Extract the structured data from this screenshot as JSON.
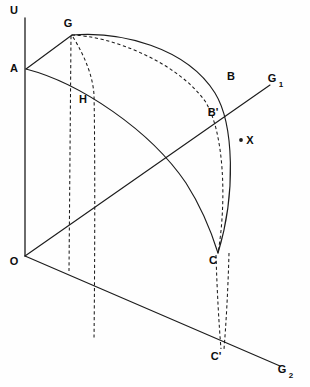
{
  "figure": {
    "background_color": "#fefefe",
    "stroke_color": "#1c1c1c",
    "width": 310,
    "height": 387
  },
  "axes": {
    "vertical": {
      "label": "U",
      "label_x": 14,
      "label_y": 11,
      "x": 25,
      "y_top": 18,
      "y_bottom": 256
    },
    "ray_upper": {
      "label": "G",
      "subscript": "1",
      "label_x": 272,
      "label_y": 79,
      "sub_x": 281,
      "sub_y": 85
    },
    "ray_lower": {
      "label": "G",
      "subscript": "2",
      "label_x": 282,
      "label_y": 370,
      "sub_x": 291,
      "sub_y": 376
    }
  },
  "points": [
    {
      "id": "U",
      "label": "U",
      "x": 25,
      "y": 18,
      "label_x": 14,
      "label_y": 11,
      "dot": false
    },
    {
      "id": "A",
      "label": "A",
      "x": 26,
      "y": 69,
      "label_x": 14,
      "label_y": 69,
      "dot": false
    },
    {
      "id": "G",
      "label": "G",
      "x": 72,
      "y": 35,
      "label_x": 68,
      "label_y": 24,
      "dot": false
    },
    {
      "id": "H",
      "label": "H",
      "x": 94,
      "y": 95,
      "label_x": 83,
      "label_y": 100,
      "dot": false
    },
    {
      "id": "B",
      "label": "B",
      "x": 236,
      "y": 86,
      "label_x": 231,
      "label_y": 77,
      "dot": false
    },
    {
      "id": "Bp",
      "label": "B'",
      "x": 226,
      "y": 120,
      "label_x": 213,
      "label_y": 113,
      "dot": false
    },
    {
      "id": "X",
      "label": "X",
      "x": 241,
      "y": 140,
      "label_x": 250,
      "label_y": 141,
      "dot": true
    },
    {
      "id": "C",
      "label": "C",
      "x": 218,
      "y": 253,
      "label_x": 213,
      "label_y": 261,
      "dot": false
    },
    {
      "id": "Cp",
      "label": "C'",
      "x": 223,
      "y": 348,
      "label_x": 216,
      "label_y": 357,
      "dot": false
    },
    {
      "id": "O",
      "label": "O",
      "x": 25,
      "y": 256,
      "label_x": 14,
      "label_y": 262,
      "dot": false
    }
  ],
  "curves": {
    "outer_arc": {
      "name": "G-B-X-C outer curve",
      "style": "solid",
      "path": "M 72 35 C 120 31 186 47 215 93 C 234 124 236 194 218 253"
    },
    "inner_arc": {
      "name": "A-H-C inner curve",
      "style": "solid",
      "path": "M 26 69 C 80 83 150 130 186 183 C 202 208 212 234 218 253"
    },
    "dashed_arc": {
      "name": "G-B'-C dashed curve",
      "style": "dashed",
      "path": "M 72 35 C 110 36 176 61 205 101 C 224 131 227 200 218 253"
    },
    "drop_g_straight": {
      "name": "G vertical drop line",
      "style": "dashed",
      "path": "M 71 36 L 69 271"
    },
    "drop_h_curve": {
      "name": "G-H lower drop line",
      "style": "dashed",
      "path": "M 73 37 C 86 58 93 78 94 95 C 95 140 95 250 94 340"
    },
    "drop_c_left": {
      "name": "C to C' dashed drop (left)",
      "style": "dashed",
      "path": "M 216 255 C 217 290 219 325 221 349"
    },
    "drop_c_right": {
      "name": "B' curve to C' dashed drop (right)",
      "style": "dashed",
      "path": "M 229 253 C 228 290 226 325 224 349"
    },
    "line_a_g": {
      "name": "A to G straight segment",
      "style": "solid",
      "path": "M 26 69 L 72 35"
    },
    "line_o_ray1": {
      "name": "O to G1 ray through B'",
      "style": "solid",
      "path": "M 25 256 L 270 85"
    },
    "line_o_ray2": {
      "name": "O to G2 ray through C'",
      "style": "solid",
      "path": "M 25 256 L 280 366"
    }
  }
}
